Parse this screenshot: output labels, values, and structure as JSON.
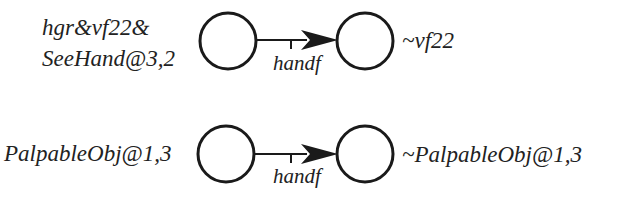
{
  "colors": {
    "stroke": "#1a1a1a",
    "text": "#222222",
    "background": "#ffffff"
  },
  "rows": [
    {
      "pre_label_lines": [
        "hgr&vf22&",
        "SeeHand@3,2"
      ],
      "edge_label": "handf",
      "post_label": "~vf22"
    },
    {
      "pre_label_lines": [
        "PalpableObj@1,3"
      ],
      "edge_label": "handf",
      "post_label": "~PalpableObj@1,3"
    }
  ]
}
